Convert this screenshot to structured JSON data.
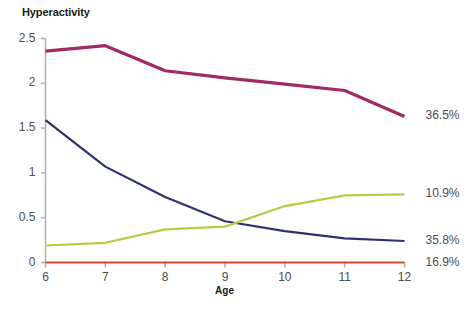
{
  "chart_data": {
    "type": "line",
    "title": "Hyperactivity",
    "xlabel": "Age",
    "ylabel": "",
    "x": [
      6,
      7,
      8,
      9,
      10,
      11,
      12
    ],
    "xticklabels": [
      "6",
      "7",
      "8",
      "9",
      "10",
      "11",
      "12"
    ],
    "yticklabels": [
      "2.5",
      "2",
      "1.5",
      "1",
      "0.5",
      "0"
    ],
    "yticks": [
      2.5,
      2,
      1.5,
      1,
      0.5,
      0
    ],
    "xlim": [
      6,
      12
    ],
    "ylim": [
      0,
      2.5
    ],
    "grid": false,
    "legend_position": "right-endpoint-labels",
    "series": [
      {
        "name": "36.5%",
        "label": "36.5%",
        "color": "#a22a64",
        "values": [
          2.36,
          2.42,
          2.14,
          2.06,
          1.99,
          1.92,
          1.63
        ]
      },
      {
        "name": "10.9%",
        "label": "10.9%",
        "color": "#b4cc47",
        "values": [
          0.19,
          0.22,
          0.37,
          0.4,
          0.63,
          0.75,
          0.76
        ]
      },
      {
        "name": "35.8%",
        "label": "35.8%",
        "color": "#2e3170",
        "values": [
          1.59,
          1.07,
          0.73,
          0.46,
          0.35,
          0.27,
          0.24
        ]
      },
      {
        "name": "16.9%",
        "label": "16.9%",
        "color": "#d4482f",
        "values": [
          0.0,
          0.0,
          0.0,
          0.0,
          0.0,
          0.0,
          0.0
        ]
      }
    ],
    "axis_color": "#b3b3b3"
  }
}
